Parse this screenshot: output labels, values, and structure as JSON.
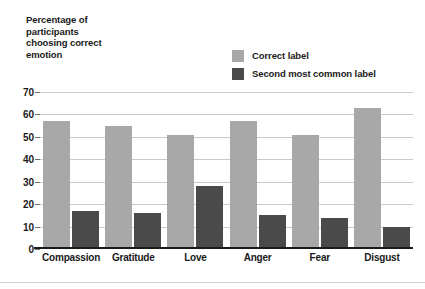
{
  "chart_data": {
    "type": "bar",
    "title": "",
    "xlabel": "",
    "ylabel": "Percentage of participants choosing correct emotion",
    "ylim": [
      0,
      70
    ],
    "yticks": [
      0,
      10,
      20,
      30,
      40,
      50,
      60,
      70
    ],
    "grid": true,
    "legend_position": "top-right",
    "categories": [
      "Compassion",
      "Gratitude",
      "Love",
      "Anger",
      "Fear",
      "Disgust"
    ],
    "series": [
      {
        "name": "Correct label",
        "color": "#a8a8a8",
        "values": [
          57,
          55,
          51,
          57,
          51,
          63
        ]
      },
      {
        "name": "Second most common label",
        "color": "#4a4a4a",
        "values": [
          17,
          16,
          28,
          15,
          14,
          10
        ]
      }
    ]
  },
  "axis_title": {
    "line1": "Percentage of",
    "line2": "participants",
    "line3": "choosing correct",
    "line4": "emotion"
  },
  "colors": {
    "series_light": "#a8a8a8",
    "series_dark": "#4a4a4a",
    "gridline": "#c9c9c9",
    "axis": "#1a1a1a",
    "text": "#1a1a1a",
    "background": "#ffffff"
  }
}
